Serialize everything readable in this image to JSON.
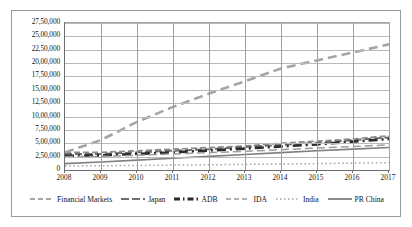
{
  "chart_data": {
    "type": "line",
    "title": "",
    "subtitle": "",
    "xlabel": "",
    "ylabel": "",
    "x": [
      2008,
      2009,
      2010,
      2011,
      2012,
      2013,
      2014,
      2015,
      2016,
      2017
    ],
    "xtick_labels": [
      "2008",
      "2009",
      "2010",
      "2011",
      "2012",
      "2013",
      "2014",
      "2015",
      "2016",
      "2017"
    ],
    "xlim": [
      2008,
      2017
    ],
    "ylim": [
      0,
      2750000
    ],
    "ytick_values": [
      0,
      250000,
      500000,
      750000,
      1000000,
      1250000,
      1500000,
      1750000,
      2000000,
      2250000,
      2500000,
      2750000
    ],
    "ytick_labels": [
      "0",
      "2,50,000",
      "5,00,000",
      "7,50,000",
      "10,00,000",
      "12,50,000",
      "15,00,000",
      "17,50,000",
      "20,00,000",
      "22,50,000",
      "25,00,000",
      "27,50,000"
    ],
    "grid": "horizontal-and-vertical",
    "legend_position": "bottom",
    "series": [
      {
        "name": "Financial Markets",
        "dash": "6 3",
        "width": 1.7,
        "color": "#8c8c8c",
        "values": [
          330000,
          330000,
          360000,
          390000,
          420000,
          450000,
          500000,
          540000,
          580000,
          640000
        ]
      },
      {
        "name": "Japan",
        "dash": "7 3",
        "width": 2.0,
        "color": "#6e6e6e",
        "values": [
          300000,
          300000,
          330000,
          360000,
          390000,
          430000,
          470000,
          510000,
          560000,
          610000
        ]
      },
      {
        "name": "ADB",
        "dash": "9 4 2 4",
        "width": 2.6,
        "color": "#2b2b2b",
        "values": [
          265000,
          275000,
          300000,
          330000,
          365000,
          400000,
          440000,
          480000,
          530000,
          580000
        ]
      },
      {
        "name": "IDA",
        "dash": "8 4",
        "width": 1.5,
        "color": "#9c9c9c",
        "values": [
          250000,
          255000,
          275000,
          300000,
          325000,
          350000,
          380000,
          410000,
          440000,
          470000
        ]
      },
      {
        "name": "India",
        "dash": "1.6 2.6",
        "width": 1.5,
        "color": "#a8a8a8",
        "values": [
          75000,
          80000,
          85000,
          92000,
          98000,
          105000,
          112000,
          120000,
          128000,
          138000
        ]
      },
      {
        "name": "PR China",
        "dash": "0",
        "width": 1.6,
        "color": "#7f7f7f",
        "values": [
          120000,
          150000,
          185000,
          220000,
          255000,
          290000,
          325000,
          360000,
          390000,
          420000
        ]
      },
      {
        "name": "PR China growth",
        "dash": "9 5",
        "width": 2.6,
        "color": "#a5a5a5",
        "values": [
          330000,
          560000,
          900000,
          1180000,
          1430000,
          1660000,
          1900000,
          2050000,
          2200000,
          2350000
        ]
      }
    ],
    "legend": [
      {
        "label": "Financial Markets",
        "style": "dashed-thin",
        "color": "#8c8c8c"
      },
      {
        "label": "Japan",
        "style": "dash-dot",
        "color": "#6e6e6e"
      },
      {
        "label": "ADB",
        "style": "dash-dot-thick",
        "color": "#2b2b2b"
      },
      {
        "label": "IDA",
        "style": "long-dash",
        "color": "#9c9c9c"
      },
      {
        "label": "India",
        "style": "dotted",
        "color": "#a8a8a8"
      },
      {
        "label": "PR China",
        "style": "solid",
        "color": "#7f7f7f"
      }
    ]
  }
}
